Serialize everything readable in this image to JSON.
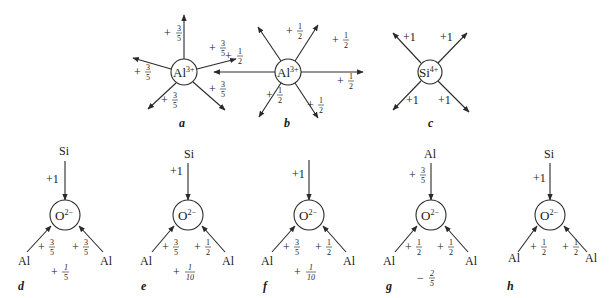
{
  "figure": {
    "panels": [
      {
        "id": "a",
        "caption": "a",
        "center_ion": "Al",
        "charge": "3+",
        "bond_strength": "+3/5",
        "coordination": 5
      },
      {
        "id": "b",
        "caption": "b",
        "center_ion": "Al",
        "charge": "3+",
        "bond_strength": "+1/2",
        "coordination": 6
      },
      {
        "id": "c",
        "caption": "c",
        "center_ion": "Si",
        "charge": "4+",
        "bond_strength": "+1",
        "coordination": 4
      },
      {
        "id": "d",
        "caption": "d",
        "center_ion": "O",
        "charge": "2−",
        "top": "Si",
        "top_strength": "+1",
        "left": "Al",
        "left_strength": "+3/5",
        "right": "Al",
        "right_strength": "+3/5",
        "excess": "+1/5"
      },
      {
        "id": "e",
        "caption": "e",
        "center_ion": "O",
        "charge": "2−",
        "top": "Si",
        "top_strength": "+1",
        "left": "Al",
        "left_strength": "+3/5",
        "right": "Al",
        "right_strength": "+1/2",
        "excess": "+1/10"
      },
      {
        "id": "f",
        "caption": "f",
        "center_ion": "O",
        "charge": "2−",
        "top": "",
        "top_strength": "+1",
        "left": "Al",
        "left_strength": "+3/5",
        "right": "Al",
        "right_strength": "+1/2",
        "excess": "+1/10"
      },
      {
        "id": "g",
        "caption": "g",
        "center_ion": "O",
        "charge": "2−",
        "top": "Al",
        "top_strength": "+3/5",
        "left": "Al",
        "left_strength": "+1/2",
        "right": "Al",
        "right_strength": "+1/2",
        "excess": "−2/5"
      },
      {
        "id": "h",
        "caption": "h",
        "center_ion": "O",
        "charge": "2−",
        "top": "Si",
        "top_strength": "+1",
        "left": "Al",
        "left_strength": "+1/2",
        "right": "Al",
        "right_strength": "+1/2",
        "excess": ""
      }
    ]
  },
  "t": {
    "al": "Al",
    "si": "Si",
    "o": "O",
    "c3": "3+",
    "c4": "4+",
    "o2": "2−",
    "plus": "+",
    "minus": "−",
    "p1": "+1",
    "n1": "1",
    "n2": "2",
    "n3": "3",
    "n5": "5",
    "n10": "10",
    "a": "a",
    "b": "b",
    "c": "c",
    "d": "d",
    "e": "e",
    "f": "f",
    "g": "g",
    "h": "h"
  }
}
